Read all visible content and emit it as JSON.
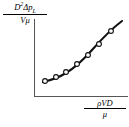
{
  "figure": {
    "type": "sketch-plot",
    "background_color": "#ffffff",
    "axis_color": "#555555",
    "curve_color": "#111111",
    "marker_fill": "#ffffff",
    "marker_stroke": "#111111"
  },
  "yaxis": {
    "label_numerator_base": "D",
    "label_numerator_exp": "2",
    "label_numerator_delta": "Δp",
    "label_numerator_sub": "L",
    "label_denominator": "Vμ",
    "label_plain": "D²Δp_L / Vμ"
  },
  "xaxis": {
    "label_numerator": "ρVD",
    "label_denominator": "μ",
    "label_plain": "ρVD / μ"
  },
  "chart_data": {
    "type": "line",
    "title": "",
    "subtitle": "",
    "xlabel": "ρVD / μ",
    "ylabel": "D²Δp_L / Vμ",
    "grid": false,
    "legend": false,
    "axis_ticks": false,
    "xlim": [
      0,
      1
    ],
    "ylim": [
      0,
      1
    ],
    "series": [
      {
        "name": "experimental data",
        "marker": "open-circle",
        "marker_count": 7,
        "x": [
          0.12,
          0.24,
          0.35,
          0.47,
          0.58,
          0.7,
          0.84
        ],
        "y": [
          0.2,
          0.26,
          0.33,
          0.43,
          0.55,
          0.69,
          0.86
        ],
        "points_px": [
          {
            "x": 45,
            "y": 81
          },
          {
            "x": 56,
            "y": 77
          },
          {
            "x": 66,
            "y": 72
          },
          {
            "x": 77,
            "y": 64
          },
          {
            "x": 88,
            "y": 55
          },
          {
            "x": 99,
            "y": 44
          },
          {
            "x": 111,
            "y": 31
          }
        ],
        "curve_px": "M 43,82 C 52,80 58,78 66,73 C 76,67 84,59 92,50 C 100,41 110,30 122,21"
      }
    ]
  }
}
